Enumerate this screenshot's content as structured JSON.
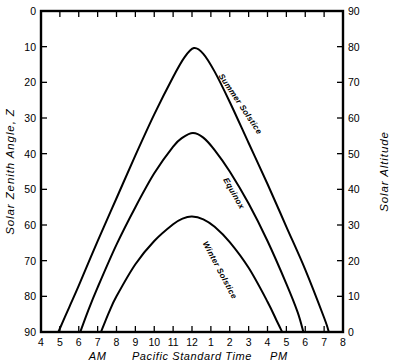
{
  "chart_data": {
    "type": "line",
    "title": "",
    "xlabel": "Pacific Standard Time",
    "ylabel": "Solar Zenith Angle, Z",
    "y2label": "Solar Altitude",
    "grid": false,
    "legend": "inline-curve-labels",
    "xlim": [
      4,
      20
    ],
    "ylim": [
      90,
      0
    ],
    "y2lim": [
      0,
      90
    ],
    "x_tick_values": [
      4,
      5,
      6,
      7,
      8,
      9,
      10,
      11,
      12,
      13,
      14,
      15,
      16,
      17,
      18,
      19,
      20
    ],
    "x_tick_labels": [
      "4",
      "5",
      "6",
      "7",
      "8",
      "9",
      "10",
      "11",
      "12",
      "1",
      "2",
      "3",
      "4",
      "5",
      "6",
      "7",
      "8"
    ],
    "y_tick_values": [
      0,
      10,
      20,
      30,
      40,
      50,
      60,
      70,
      80,
      90
    ],
    "y_tick_labels": [
      "0",
      "10",
      "20",
      "30",
      "40",
      "50",
      "60",
      "70",
      "80",
      "90"
    ],
    "y2_tick_values": [
      90,
      80,
      70,
      60,
      50,
      40,
      30,
      20,
      10,
      0
    ],
    "y2_tick_labels": [
      "90",
      "80",
      "70",
      "60",
      "50",
      "40",
      "30",
      "20",
      "10",
      "0"
    ],
    "period_markers": [
      {
        "label": "AM",
        "x": 7.0
      },
      {
        "label": "PM",
        "x": 16.6
      }
    ],
    "series": [
      {
        "name": "Summer Solstice",
        "label_x": 14.45,
        "label_y": 26.5,
        "label_angle": 56,
        "peak": {
          "x": 12.1,
          "y": 10.4
        },
        "sunrise_x": 4.92,
        "sunset_x": 19.25,
        "points": [
          {
            "x": 4.92,
            "y": 90.0
          },
          {
            "x": 5.5,
            "y": 83.0
          },
          {
            "x": 6.0,
            "y": 77.0
          },
          {
            "x": 7.0,
            "y": 64.5
          },
          {
            "x": 8.0,
            "y": 52.5
          },
          {
            "x": 9.0,
            "y": 40.5
          },
          {
            "x": 10.0,
            "y": 29.0
          },
          {
            "x": 11.0,
            "y": 18.5
          },
          {
            "x": 11.6,
            "y": 13.0
          },
          {
            "x": 12.1,
            "y": 10.4
          },
          {
            "x": 12.6,
            "y": 12.0
          },
          {
            "x": 13.2,
            "y": 17.0
          },
          {
            "x": 14.0,
            "y": 25.5
          },
          {
            "x": 15.0,
            "y": 37.0
          },
          {
            "x": 16.0,
            "y": 48.5
          },
          {
            "x": 17.0,
            "y": 60.5
          },
          {
            "x": 18.0,
            "y": 72.5
          },
          {
            "x": 19.0,
            "y": 86.0
          },
          {
            "x": 19.25,
            "y": 90.0
          }
        ]
      },
      {
        "name": "Equinox",
        "label_x": 14.1,
        "label_y": 51.5,
        "label_angle": 60,
        "peak": {
          "x": 12.05,
          "y": 34.2
        },
        "sunrise_x": 6.08,
        "sunset_x": 17.9,
        "points": [
          {
            "x": 6.08,
            "y": 90.0
          },
          {
            "x": 6.5,
            "y": 84.0
          },
          {
            "x": 7.0,
            "y": 77.5
          },
          {
            "x": 8.0,
            "y": 65.5
          },
          {
            "x": 9.0,
            "y": 55.0
          },
          {
            "x": 10.0,
            "y": 45.5
          },
          {
            "x": 11.0,
            "y": 38.0
          },
          {
            "x": 11.5,
            "y": 35.5
          },
          {
            "x": 12.05,
            "y": 34.2
          },
          {
            "x": 12.6,
            "y": 35.5
          },
          {
            "x": 13.2,
            "y": 39.0
          },
          {
            "x": 14.0,
            "y": 45.0
          },
          {
            "x": 15.0,
            "y": 54.0
          },
          {
            "x": 16.0,
            "y": 64.5
          },
          {
            "x": 17.0,
            "y": 76.5
          },
          {
            "x": 17.6,
            "y": 84.5
          },
          {
            "x": 17.9,
            "y": 90.0
          }
        ]
      },
      {
        "name": "Winter Solstice",
        "label_x": 13.35,
        "label_y": 73.0,
        "label_angle": 62,
        "peak": {
          "x": 12.0,
          "y": 57.6
        },
        "sunrise_x": 7.18,
        "sunset_x": 16.78,
        "points": [
          {
            "x": 7.18,
            "y": 90.0
          },
          {
            "x": 7.6,
            "y": 84.5
          },
          {
            "x": 8.0,
            "y": 80.0
          },
          {
            "x": 9.0,
            "y": 71.0
          },
          {
            "x": 10.0,
            "y": 64.5
          },
          {
            "x": 11.0,
            "y": 59.8
          },
          {
            "x": 11.5,
            "y": 58.2
          },
          {
            "x": 12.0,
            "y": 57.6
          },
          {
            "x": 12.6,
            "y": 58.4
          },
          {
            "x": 13.2,
            "y": 60.5
          },
          {
            "x": 14.0,
            "y": 64.8
          },
          {
            "x": 15.0,
            "y": 72.0
          },
          {
            "x": 16.0,
            "y": 81.5
          },
          {
            "x": 16.5,
            "y": 87.0
          },
          {
            "x": 16.78,
            "y": 90.0
          }
        ]
      }
    ]
  }
}
